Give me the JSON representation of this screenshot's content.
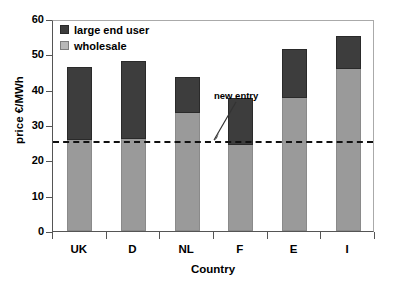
{
  "chart_data": {
    "type": "bar",
    "stacked": true,
    "title": "",
    "xlabel": "Country",
    "ylabel": "price €/MWh",
    "categories": [
      "UK",
      "D",
      "NL",
      "F",
      "E",
      "I"
    ],
    "ylim": [
      0,
      60
    ],
    "yticks": [
      0,
      10,
      20,
      30,
      40,
      50,
      60
    ],
    "ytick_labels": [
      "0",
      "10",
      "20",
      "30",
      "40",
      "50",
      "60"
    ],
    "grid": false,
    "legend_position": "top-left",
    "series": [
      {
        "name": "wholesale",
        "color": "#9a9a9a",
        "values": [
          25.8,
          26.1,
          33.4,
          24.4,
          37.7,
          45.9
        ]
      },
      {
        "name": "large end user",
        "color": "#3d3d3d",
        "values": [
          20.5,
          21.9,
          10.2,
          13.3,
          13.9,
          9.3
        ]
      }
    ],
    "totals": [
      46.3,
      48.0,
      43.6,
      37.7,
      51.6,
      55.2
    ],
    "annotations": [
      {
        "label": "new entry",
        "value": 26,
        "style": "dashed-horizontal-line",
        "color": "#111111"
      }
    ]
  },
  "legend": {
    "items": [
      {
        "label": "large end user",
        "swatch": "dark"
      },
      {
        "label": "wholesale",
        "swatch": "light"
      }
    ]
  }
}
